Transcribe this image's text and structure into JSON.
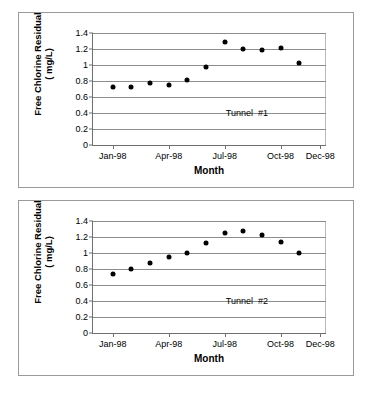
{
  "chart_data": [
    {
      "type": "scatter",
      "title": "",
      "annotation": "Tunnel  #1",
      "xlabel": "Month",
      "ylabel": "Free Chlorine Residual\n( mg/L)",
      "ylim": [
        0,
        1.4
      ],
      "yticks": [
        "0",
        "0.2",
        "0.4",
        "0.6",
        "0.8",
        "1",
        "1.2",
        "1.4"
      ],
      "ytick_values": [
        0,
        0.2,
        0.4,
        0.6,
        0.8,
        1,
        1.2,
        1.4
      ],
      "xticks": [
        "Jan-98",
        "Apr-98",
        "Jul-98",
        "Oct-98",
        "Dec-98"
      ],
      "xtick_positions": [
        0.085,
        0.325,
        0.565,
        0.805,
        0.975
      ],
      "grid": true,
      "legend": "none",
      "categories": [
        "Jan-98",
        "Feb-98",
        "Mar-98",
        "Apr-98",
        "May-98",
        "Jun-98",
        "Jul-98",
        "Aug-98",
        "Sep-98",
        "Oct-98",
        "Nov-98",
        "Dec-98"
      ],
      "x": [
        0.085,
        0.165,
        0.245,
        0.325,
        0.405,
        0.485,
        0.565,
        0.645,
        0.725,
        0.805,
        0.885,
        0.955
      ],
      "values": [
        0.73,
        0.72,
        0.78,
        0.75,
        0.81,
        0.98,
        1.29,
        1.2,
        1.19,
        1.21,
        1.02,
        null
      ]
    },
    {
      "type": "scatter",
      "title": "",
      "annotation": "Tunnel  #2",
      "xlabel": "Month",
      "ylabel": "Free Chlorine Residual\n( mg/L)",
      "ylim": [
        0,
        1.4
      ],
      "yticks": [
        "0",
        "0.2",
        "0.4",
        "0.6",
        "0.8",
        "1",
        "1.2",
        "1.4"
      ],
      "ytick_values": [
        0,
        0.2,
        0.4,
        0.6,
        0.8,
        1,
        1.2,
        1.4
      ],
      "xticks": [
        "Jan-98",
        "Apr-98",
        "Jul-98",
        "Oct-98",
        "Dec-98"
      ],
      "xtick_positions": [
        0.085,
        0.325,
        0.565,
        0.805,
        0.975
      ],
      "grid": true,
      "legend": "none",
      "categories": [
        "Jan-98",
        "Feb-98",
        "Mar-98",
        "Apr-98",
        "May-98",
        "Jun-98",
        "Jul-98",
        "Aug-98",
        "Sep-98",
        "Oct-98",
        "Nov-98",
        "Dec-98"
      ],
      "x": [
        0.085,
        0.165,
        0.245,
        0.325,
        0.405,
        0.485,
        0.565,
        0.645,
        0.725,
        0.805,
        0.885,
        0.955
      ],
      "values": [
        0.74,
        0.8,
        0.87,
        0.95,
        1.0,
        1.13,
        1.25,
        1.28,
        1.23,
        1.14,
        1.0,
        null
      ]
    }
  ],
  "charts": [
    {
      "panel_name": "tunnel-1-chart-panel",
      "ylabel_line1": "Free Chlorine Residual",
      "ylabel_line2": "( mg/L)",
      "xlabel": "Month",
      "annotation": "Tunnel  #1"
    },
    {
      "panel_name": "tunnel-2-chart-panel",
      "ylabel_line1": "Free Chlorine Residual",
      "ylabel_line2": "( mg/L)",
      "xlabel": "Month",
      "annotation": "Tunnel  #2"
    }
  ]
}
